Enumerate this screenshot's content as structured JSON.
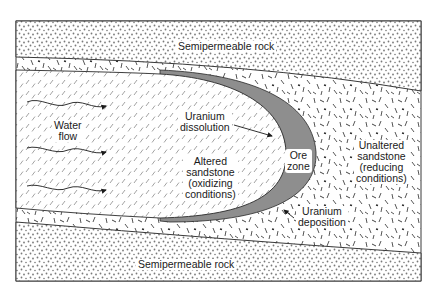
{
  "diagram": {
    "colors": {
      "frame": "#3a3a3a",
      "ore_zone": "#8e8e8e",
      "rock_dots": "#7a7a7a",
      "hatch": "#8a8a8a",
      "unaltered_marks": "#2a2a2a"
    },
    "layers": {
      "top_rock": {
        "label": "Semipermeable rock",
        "pattern": "dotted"
      },
      "bottom_rock": {
        "label": "Semipermeable rock",
        "pattern": "dotted"
      },
      "altered_sandstone": {
        "lines": [
          "Altered",
          "sandstone",
          "(oxidizing",
          "conditions)"
        ],
        "pattern": "diagonal-hatch"
      },
      "unaltered_sandstone": {
        "lines": [
          "Unaltered",
          "sandstone",
          "(reducing",
          "conditions)"
        ],
        "pattern": "random-dashes"
      },
      "ore_zone": {
        "lines": [
          "Ore",
          "zone"
        ],
        "fill": "gray"
      }
    },
    "annotations": {
      "water_flow": {
        "lines": [
          "Water",
          "flow"
        ],
        "arrow_count": 3
      },
      "uranium_dissolution": {
        "lines": [
          "Uranium",
          "dissolution"
        ]
      },
      "uranium_deposition": {
        "lines": [
          "Uranium",
          "deposition"
        ]
      }
    }
  }
}
